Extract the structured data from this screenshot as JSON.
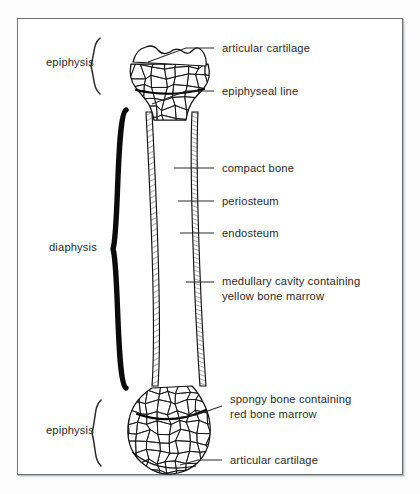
{
  "figure": {
    "background_color": "#ffffff",
    "frame_color": "#6d6f71",
    "ink_color": "#111111",
    "text_color": "#2b2b2b"
  },
  "callouts": [
    {
      "id": "articular-cartilage-top",
      "lines": [
        "articular cartilage"
      ],
      "text_x": 222,
      "text_y": 52,
      "leader": "M 214 48 L 186 48 L 148 62"
    },
    {
      "id": "epiphyseal-line",
      "lines": [
        "epiphyseal line"
      ],
      "text_x": 222,
      "text_y": 95,
      "leader": "M 214 91 L 186 91 L 152 104"
    },
    {
      "id": "compact-bone",
      "lines": [
        "compact bone"
      ],
      "text_x": 222,
      "text_y": 172,
      "leader": "M 214 168 L 174 168"
    },
    {
      "id": "periosteum",
      "lines": [
        "periosteum"
      ],
      "text_x": 222,
      "text_y": 205,
      "leader": "M 214 201 L 178 201"
    },
    {
      "id": "endosteum",
      "lines": [
        "endosteum"
      ],
      "text_x": 222,
      "text_y": 237,
      "leader": "M 214 233 L 180 233"
    },
    {
      "id": "medullary-cavity",
      "lines": [
        "medullary cavity containing",
        "yellow bone marrow"
      ],
      "text_x": 222,
      "text_y": 285,
      "leader": "M 214 282 L 186 282"
    },
    {
      "id": "spongy-bone",
      "lines": [
        "spongy bone containing",
        "red bone marrow"
      ],
      "text_x": 230,
      "text_y": 403,
      "leader": "M 222 406 L 196 415 L 176 418"
    },
    {
      "id": "articular-cartilage-bottom",
      "lines": [
        "articular cartilage"
      ],
      "text_x": 230,
      "text_y": 464,
      "leader": "M 222 460 L 198 460 L 180 465"
    }
  ],
  "braces": [
    {
      "id": "epiphysis-top",
      "label": "epiphysis",
      "label_x": 94,
      "label_y": 66,
      "weight": "thin",
      "x": 100,
      "y_top": 38,
      "y_bottom": 94
    },
    {
      "id": "diaphysis",
      "label": "diaphysis",
      "label_x": 97,
      "label_y": 251,
      "weight": "thick",
      "x": 126,
      "y_top": 110,
      "y_bottom": 388
    },
    {
      "id": "epiphysis-bottom",
      "label": "epiphysis",
      "label_x": 94,
      "label_y": 434,
      "weight": "thin",
      "x": 101,
      "y_top": 400,
      "y_bottom": 466
    }
  ],
  "bone": {
    "type": "long-bone-longitudinal-section",
    "top_epiphysis": {
      "cartilage_cap": "M 133 62 Q 136 49 146 47 Q 153 44 158 50 Q 163 56 170 52 Q 176 47 182 51 Q 188 56 193 50 Q 198 45 203 52 Q 207 58 206 66 Z",
      "head_outline": "M 131 64 Q 128 78 136 88 L 146 100 Q 152 108 154 120 L 186 120 Q 188 107 194 99 L 204 88 Q 212 78 208 64 Z",
      "epiphyseal_line_path": "M 136 90 Q 170 98 204 89",
      "center_x": 170,
      "width": 80
    },
    "shaft": {
      "left_wall_outer_top_x": 150,
      "left_wall_outer_bottom_x": 158,
      "right_wall_outer_top_x": 190,
      "right_wall_outer_bottom_x": 196,
      "wall_thickness": 6,
      "y_top": 112,
      "y_bottom": 386,
      "medullary_fill": "#ffffff"
    },
    "bottom_epiphysis": {
      "outline": "M 152 388 Q 130 402 128 426 Q 126 452 146 466 Q 160 477 178 473 Q 200 468 208 446 Q 214 424 204 404 Q 198 392 192 386 Z",
      "epiphyseal_line_path": "M 137 414 Q 172 426 206 410",
      "cartilage_rim": "M 132 452 Q 158 474 196 466",
      "center_x": 168,
      "radius": 44
    },
    "trabecular_seed": 7
  }
}
